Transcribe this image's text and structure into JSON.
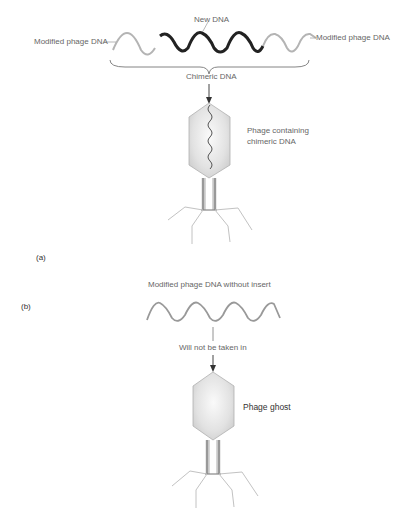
{
  "panel_a": {
    "label": "(a)",
    "new_dna_label": "New DNA",
    "left_label": "Modified phage DNA",
    "right_label": "Modified phage DNA",
    "chimeric_label": "Chimeric DNA",
    "phage_label_line1": "Phage containing",
    "phage_label_line2": "chimeric DNA"
  },
  "panel_b": {
    "label": "(b)",
    "title": "Modified phage DNA without insert",
    "arrow_label": "Will not be taken in",
    "phage_label": "Phage ghost"
  },
  "colors": {
    "new_dna": "#222222",
    "phage_dna": "#aaaaaa",
    "capsid_fill": "#e4e4e4",
    "capsid_stroke": "#b0b0b0",
    "leg": "#bbbbbb"
  }
}
